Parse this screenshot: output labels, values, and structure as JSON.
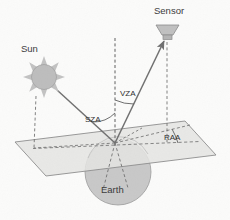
{
  "diagram": {
    "background_color": "#fbfbfa",
    "labels": {
      "sun": "Sun",
      "sensor": "Sensor",
      "earth": "Earth",
      "sza": "SZA",
      "vza": "VZA",
      "raa": "RAA"
    },
    "colors": {
      "fill_gray": "#c9c9c9",
      "plane_fill": "#e2e2e0",
      "stroke_gray": "#8d8d8d",
      "line_dark": "#6f6f6f",
      "text": "#3a3a3a"
    },
    "elements": {
      "sun_icon": "sun-icon",
      "sensor_icon": "sensor-icon",
      "earth_icon": "earth-sphere",
      "ground_plane": "ground-plane-parallelogram",
      "zenith_line": "zenith-dashed-line",
      "sun_ray": "incoming-solar-ray",
      "view_ray": "outgoing-view-ray",
      "sza_arc": "solar-zenith-angle-arc",
      "vza_arc": "view-zenith-angle-arc",
      "raa_arc": "relative-azimuth-angle-arc"
    },
    "geometry": {
      "target_point": {
        "x": 115,
        "y": 143
      },
      "sun_center": {
        "x": 44,
        "y": 77
      },
      "sensor_center": {
        "x": 167,
        "y": 30
      },
      "earth_center": {
        "x": 118,
        "y": 172
      },
      "earth_radius": 33,
      "plane_corners": "46,176 15,142 185,121 216,155"
    }
  }
}
